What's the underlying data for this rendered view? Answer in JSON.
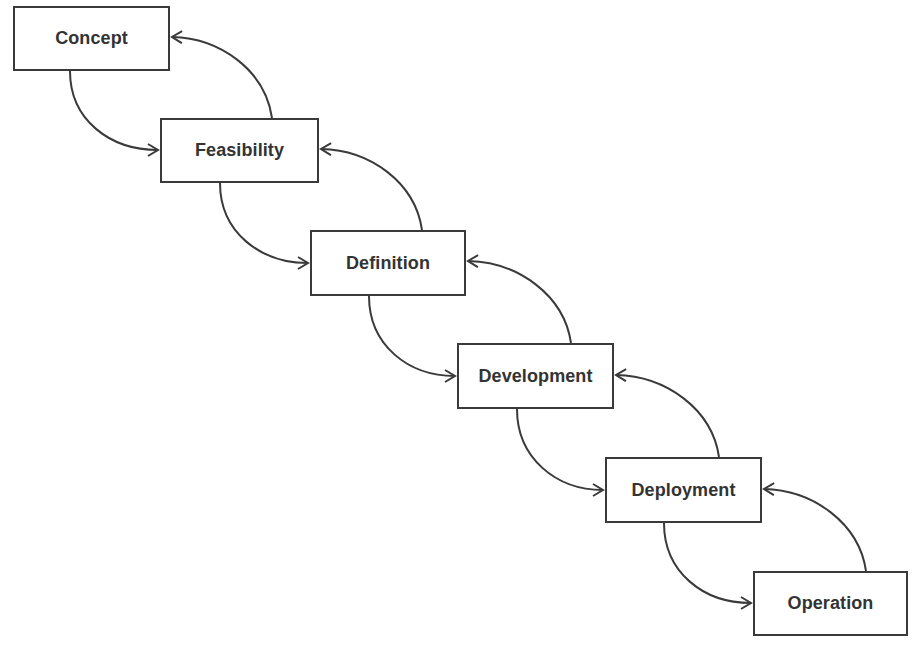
{
  "diagram": {
    "type": "waterfall-lifecycle",
    "stages": [
      {
        "label": "Concept",
        "x": 13,
        "y": 6,
        "w": 157,
        "h": 65
      },
      {
        "label": "Feasibility",
        "x": 160,
        "y": 118,
        "w": 159,
        "h": 65
      },
      {
        "label": "Definition",
        "x": 310,
        "y": 230,
        "w": 156,
        "h": 66
      },
      {
        "label": "Development",
        "x": 457,
        "y": 343,
        "w": 157,
        "h": 66
      },
      {
        "label": "Deployment",
        "x": 605,
        "y": 457,
        "w": 157,
        "h": 66
      },
      {
        "label": "Operation",
        "x": 753,
        "y": 571,
        "w": 155,
        "h": 65
      }
    ],
    "edges": [
      {
        "from": "Concept",
        "to": "Feasibility",
        "direction": "forward"
      },
      {
        "from": "Feasibility",
        "to": "Concept",
        "direction": "backward"
      },
      {
        "from": "Feasibility",
        "to": "Definition",
        "direction": "forward"
      },
      {
        "from": "Definition",
        "to": "Feasibility",
        "direction": "backward"
      },
      {
        "from": "Definition",
        "to": "Development",
        "direction": "forward"
      },
      {
        "from": "Development",
        "to": "Definition",
        "direction": "backward"
      },
      {
        "from": "Development",
        "to": "Deployment",
        "direction": "forward"
      },
      {
        "from": "Deployment",
        "to": "Development",
        "direction": "backward"
      },
      {
        "from": "Deployment",
        "to": "Operation",
        "direction": "forward"
      },
      {
        "from": "Operation",
        "to": "Deployment",
        "direction": "backward"
      }
    ],
    "colors": {
      "line": "#3a3a3a",
      "text": "#333333",
      "background": "#ffffff"
    }
  }
}
